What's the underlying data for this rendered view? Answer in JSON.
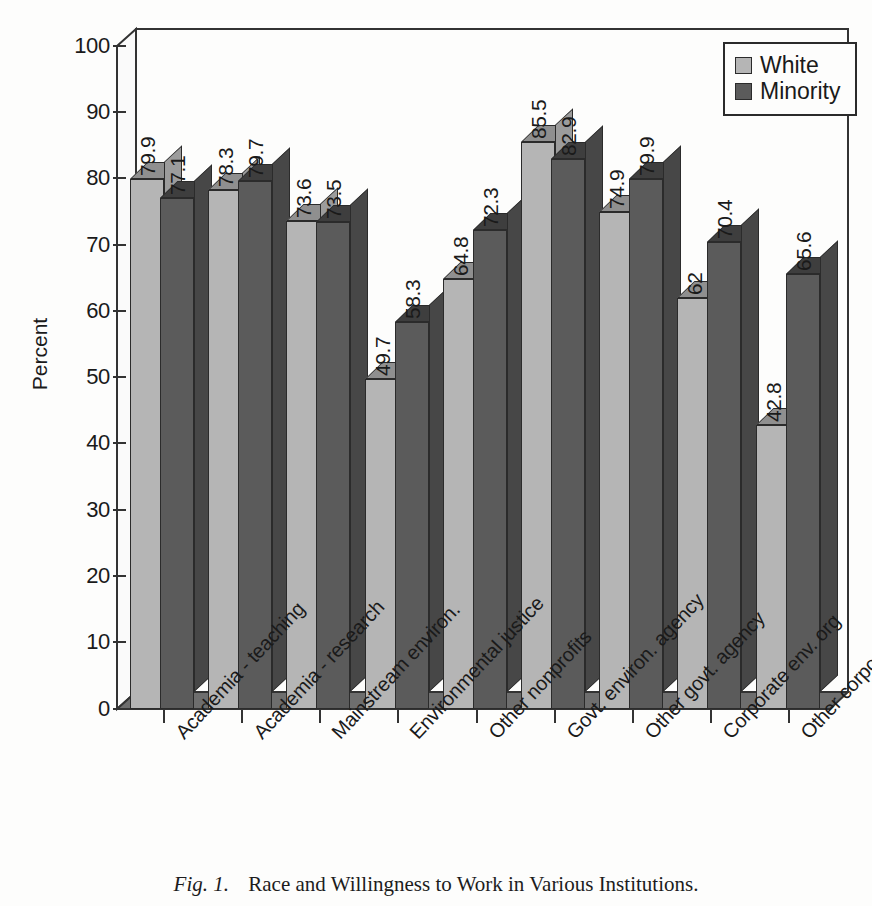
{
  "figure": {
    "caption_number": "Fig. 1.",
    "caption_text": "Race and Willingness to Work in Various Institutions."
  },
  "legend": {
    "position": "top-right",
    "entries": [
      {
        "label": "White",
        "swatch": "light-gray-square",
        "color": "#b5b5b5"
      },
      {
        "label": "Minority",
        "swatch": "dark-gray-square",
        "color": "#5b5b5b"
      }
    ]
  },
  "axes": {
    "y_title": "Percent",
    "y_ticks": [
      "0",
      "10",
      "20",
      "30",
      "40",
      "50",
      "60",
      "70",
      "80",
      "90",
      "100"
    ]
  },
  "chart_data": {
    "type": "bar",
    "title": "Race and Willingness to Work in Various Institutions.",
    "xlabel": "",
    "ylabel": "Percent",
    "ylim": [
      0,
      100
    ],
    "grid": false,
    "legend_position": "top-right",
    "style": "3d-clustered-columns",
    "categories": [
      "Academia - teaching",
      "Academia - research",
      "Mainstream environ.",
      "Environmental justice",
      "Other nonprofits",
      "Govt. environ. agency",
      "Other govt. agency",
      "Corporate env. org",
      "Other corporate orgs"
    ],
    "series": [
      {
        "name": "White",
        "color": "#b5b5b5",
        "values": [
          79.9,
          78.3,
          73.6,
          49.7,
          64.8,
          85.5,
          74.9,
          62,
          42.8
        ],
        "labels": [
          "79.9",
          "78.3",
          "73.6",
          "49.7",
          "64.8",
          "85.5",
          "74.9",
          "62",
          "42.8"
        ]
      },
      {
        "name": "Minority",
        "color": "#5b5b5b",
        "values": [
          77.1,
          79.7,
          73.5,
          58.3,
          72.3,
          82.9,
          79.9,
          70.4,
          65.6
        ],
        "labels": [
          "77.1",
          "79.7",
          "73.5",
          "58.3",
          "72.3",
          "82.9",
          "79.9",
          "70.4",
          "65.6"
        ]
      }
    ]
  }
}
